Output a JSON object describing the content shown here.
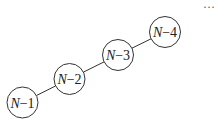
{
  "diagram": {
    "type": "linked-chain",
    "nodes": [
      {
        "id": "n1",
        "var": "N",
        "suffix": "−1",
        "cx": 22.5,
        "cy": 102.5,
        "r": 15.5
      },
      {
        "id": "n2",
        "var": "N",
        "suffix": "−2",
        "cx": 69.5,
        "cy": 79,
        "r": 15.5
      },
      {
        "id": "n3",
        "var": "N",
        "suffix": "−3",
        "cx": 118,
        "cy": 55,
        "r": 15.5
      },
      {
        "id": "n4",
        "var": "N",
        "suffix": "−4",
        "cx": 165,
        "cy": 32,
        "r": 15.5
      }
    ],
    "edges": [
      [
        "n1",
        "n2"
      ],
      [
        "n2",
        "n3"
      ],
      [
        "n3",
        "n4"
      ]
    ],
    "continuation": "···",
    "colors": {
      "stroke": "#333333",
      "fill": "#ffffff",
      "text": "#222222"
    }
  }
}
